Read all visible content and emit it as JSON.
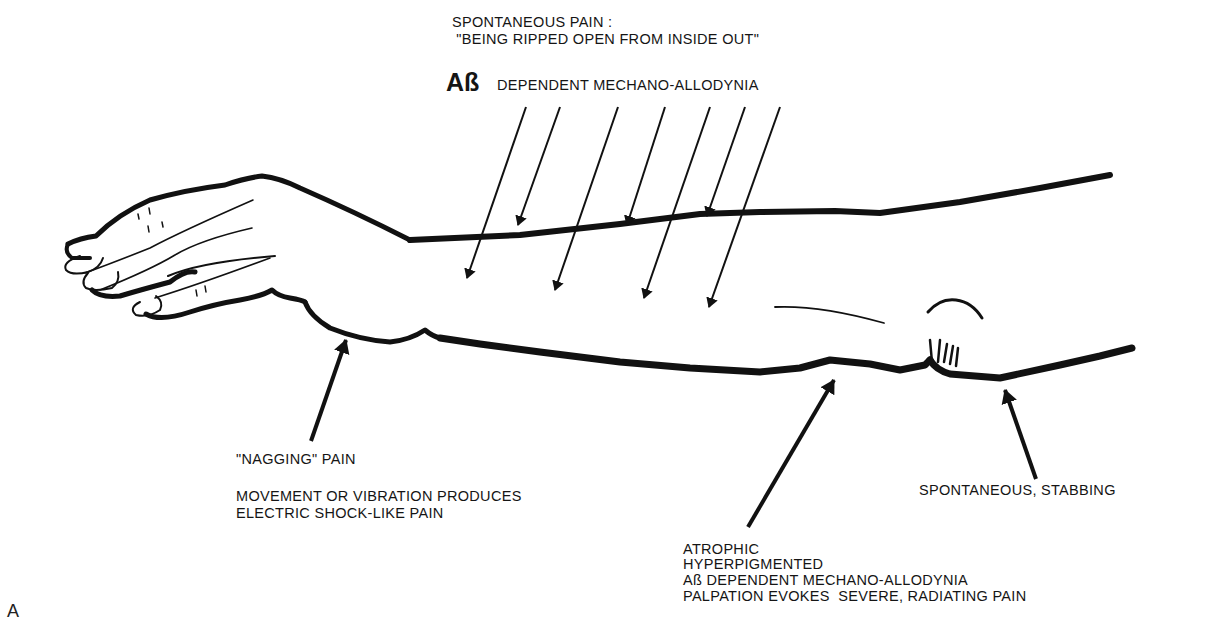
{
  "figure": {
    "panel_label": "A",
    "colors": {
      "ink": "#111111",
      "background": "#ffffff"
    }
  },
  "annotations": {
    "top": {
      "line1": "SPONTANEOUS PAIN :",
      "line2": " \"BEING RIPPED OPEN FROM INSIDE OUT\"",
      "ab_symbol": "Aß",
      "ab_text": "DEPENDENT MECHANO-ALLODYNIA"
    },
    "left": {
      "title": "\"NAGGING\" PAIN",
      "line1": "MOVEMENT OR VIBRATION PRODUCES",
      "line2": "ELECTRIC SHOCK-LIKE PAIN"
    },
    "bottom_center": {
      "line1": "ATROPHIC",
      "line2": "HYPERPIGMENTED",
      "line3": "Aß DEPENDENT MECHANO-ALLODYNIA",
      "line4": "PALPATION EVOKES  SEVERE, RADIATING PAIN"
    },
    "right": {
      "line1": "SPONTANEOUS, STABBING"
    }
  },
  "arrows": {
    "top_count": 7,
    "bottom_count": 3
  }
}
